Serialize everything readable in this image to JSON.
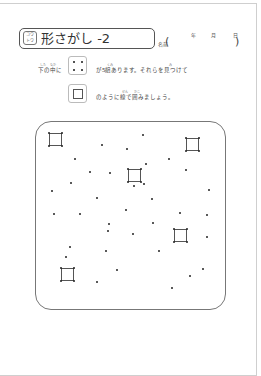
{
  "header": {
    "icon_top": "コウ",
    "icon_bottom": "トウ",
    "title": "形さがし -2",
    "name_label": "名前",
    "name_open": "(",
    "name_close": ")",
    "date_labels": [
      "年",
      "月",
      "日"
    ]
  },
  "instructions": {
    "line1_prefix": "下の中に",
    "line1_suffix": "が5組あります。それらを見つけて",
    "line2_suffix": "のように線で囲みましょう。",
    "ruby": {
      "shita": "した",
      "naka": "なか",
      "kumi": "くみ",
      "mi": "み",
      "sen": "せん",
      "kako": "かこ"
    }
  },
  "example": {
    "dots_box": "four-dots-example",
    "square_box": "square-outline-example"
  },
  "puzzle": {
    "squares": [
      {
        "x": 49,
        "y": 133,
        "w": 13,
        "h": 13
      },
      {
        "x": 186,
        "y": 138,
        "w": 13,
        "h": 13
      },
      {
        "x": 128,
        "y": 169,
        "w": 13,
        "h": 13
      },
      {
        "x": 174,
        "y": 229,
        "w": 13,
        "h": 13
      },
      {
        "x": 61,
        "y": 268,
        "w": 13,
        "h": 13
      }
    ],
    "dots": [
      [
        143,
        135
      ],
      [
        102,
        145
      ],
      [
        127,
        149
      ],
      [
        75,
        159
      ],
      [
        169,
        159
      ],
      [
        146,
        164
      ],
      [
        90,
        172
      ],
      [
        110,
        173
      ],
      [
        186,
        170
      ],
      [
        71,
        183
      ],
      [
        134,
        186
      ],
      [
        144,
        184
      ],
      [
        52,
        191
      ],
      [
        209,
        190
      ],
      [
        97,
        198
      ],
      [
        152,
        199
      ],
      [
        54,
        214
      ],
      [
        80,
        214
      ],
      [
        126,
        210
      ],
      [
        180,
        213
      ],
      [
        207,
        215
      ],
      [
        109,
        224
      ],
      [
        153,
        223
      ],
      [
        108,
        231
      ],
      [
        133,
        234
      ],
      [
        207,
        237
      ],
      [
        70,
        247
      ],
      [
        66,
        257
      ],
      [
        106,
        251
      ],
      [
        159,
        251
      ],
      [
        117,
        270
      ],
      [
        203,
        269
      ],
      [
        190,
        276
      ],
      [
        97,
        282
      ],
      [
        172,
        288
      ]
    ]
  }
}
